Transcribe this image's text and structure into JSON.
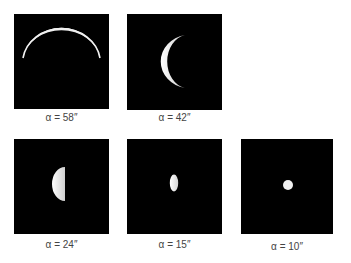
{
  "figure": {
    "panels": [
      {
        "label": "α = 58″",
        "angular_size": "58″",
        "phase": "thin crescent"
      },
      {
        "label": "α = 42″",
        "angular_size": "42″",
        "phase": "crescent"
      },
      {
        "label": "α = 24″",
        "angular_size": "24″",
        "phase": "half"
      },
      {
        "label": "α = 15″",
        "angular_size": "15″",
        "phase": "gibbous"
      },
      {
        "label": "α = 10″",
        "angular_size": "10″",
        "phase": "nearly full"
      }
    ],
    "colors": {
      "background": "#ffffff",
      "frame": "#000000",
      "planet": "#f2f2f2",
      "label": "#444444"
    }
  }
}
